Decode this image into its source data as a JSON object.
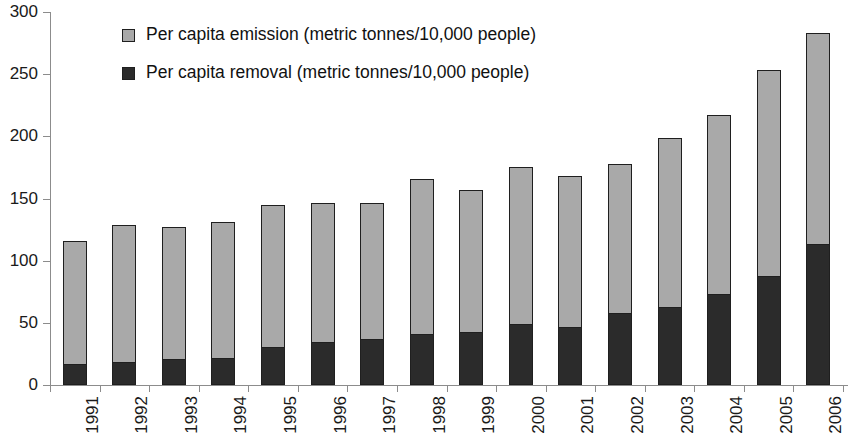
{
  "chart_data": {
    "type": "bar",
    "stacked": true,
    "title": "",
    "subtitle": "",
    "xlabel": "",
    "ylabel": "",
    "ylim": [
      0,
      300
    ],
    "ytick_step": 50,
    "yticks": [
      "0",
      "50",
      "100",
      "150",
      "200",
      "250",
      "300"
    ],
    "grid": false,
    "legend_position": "top-center",
    "categories": [
      "1991",
      "1992",
      "1993",
      "1994",
      "1995",
      "1996",
      "1997",
      "1998",
      "1999",
      "2000",
      "2001",
      "2002",
      "2003",
      "2004",
      "2005",
      "2006"
    ],
    "series": [
      {
        "name": "Per capita removal (metric tonnes/10,000 people)",
        "color": "#2b2b2b",
        "values": [
          16,
          18,
          20,
          21,
          30,
          34,
          36,
          40,
          42,
          48,
          46,
          57,
          62,
          72,
          87,
          113
        ]
      },
      {
        "name": "Per capita emission (metric tonnes/10,000 people)",
        "color": "#a9a9a9",
        "values": [
          100,
          111,
          107,
          110,
          115,
          112,
          110,
          126,
          115,
          127,
          122,
          121,
          137,
          145,
          166,
          170
        ]
      }
    ],
    "totals": [
      116,
      129,
      127,
      131,
      145,
      146,
      146,
      166,
      157,
      175,
      168,
      178,
      199,
      217,
      253,
      283
    ]
  },
  "legend": {
    "items": [
      {
        "label": "Per capita emission (metric tonnes/10,000 people)",
        "color": "#a9a9a9"
      },
      {
        "label": "Per capita removal (metric tonnes/10,000 people)",
        "color": "#2b2b2b"
      }
    ]
  },
  "colors": {
    "emission": "#a9a9a9",
    "removal": "#2b2b2b",
    "axis": "#8c8c8c",
    "bar_outline": "#1f1f1f",
    "text": "#1a1a1a",
    "background": "#ffffff"
  }
}
